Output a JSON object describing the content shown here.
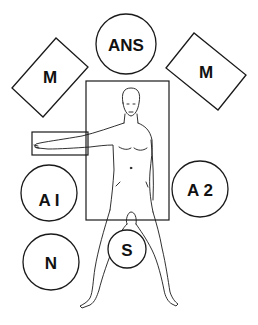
{
  "diagram": {
    "title": "",
    "labels": {
      "anesthesia": "ANS",
      "monitor_left": "M",
      "monitor_right": "M",
      "assistant_1": "A I",
      "assistant_2": "A 2",
      "nurse": "N",
      "surgeon": "S"
    },
    "colors": {
      "stroke": "#1a1a1a",
      "background": "#ffffff"
    }
  }
}
